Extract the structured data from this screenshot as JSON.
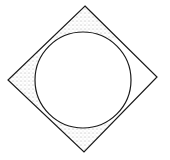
{
  "diagram": {
    "colors": {
      "background": "#ffffff",
      "stroke": "#1a1a1a",
      "stipple": "#555555"
    },
    "square": {
      "vertices": {
        "top": [
          85,
          6
        ],
        "right": [
          157,
          77
        ],
        "bottom": [
          84,
          152
        ],
        "left": [
          8,
          80
        ]
      }
    },
    "circle": {
      "cx": 83,
      "cy": 80,
      "r": 48
    },
    "shaded_corners": [
      "top",
      "left",
      "bottom"
    ],
    "unshaded_corners": [
      "right"
    ]
  }
}
